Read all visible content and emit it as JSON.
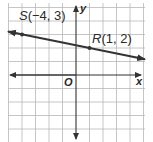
{
  "diagram": {
    "type": "coordinate-plane",
    "grid": {
      "x_min": -5,
      "x_max": 5,
      "y_min": -5,
      "y_max": 5,
      "color": "#b8b8b8"
    },
    "axes": {
      "x_label": "x",
      "y_label": "y",
      "origin_label": "O",
      "color": "#333333"
    },
    "line": {
      "color": "#333333",
      "through": [
        "S",
        "R"
      ],
      "slope": "-1/5"
    },
    "points": [
      {
        "name": "S",
        "coords": "(−4, 3)",
        "x": -4,
        "y": 3
      },
      {
        "name": "R",
        "coords": "(1, 2)",
        "x": 1,
        "y": 2
      }
    ]
  }
}
